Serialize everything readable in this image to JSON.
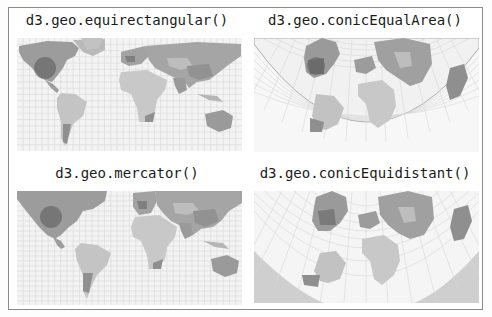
{
  "figure": {
    "background": "#ffffff",
    "border_color": "#8a8a8a",
    "palette": {
      "ocean": "#f3f3f3",
      "graticule": "#d6d6d6",
      "land_light": "#c9c9c9",
      "land_mid": "#a9a9a9",
      "land_dark": "#8d8d8d",
      "highlight_circle": "#6a6a6a"
    }
  },
  "panels": [
    {
      "title": "d3.geo.equirectangular()",
      "projection": "equirectangular",
      "has_highlight_circle": true
    },
    {
      "title": "d3.geo.conicEqualArea()",
      "projection": "conicEqualArea",
      "has_highlight_circle": true
    },
    {
      "title": "d3.geo.mercator()",
      "projection": "mercator",
      "has_highlight_circle": true
    },
    {
      "title": "d3.geo.conicEquidistant()",
      "projection": "conicEquidistant",
      "has_highlight_circle": false
    }
  ]
}
